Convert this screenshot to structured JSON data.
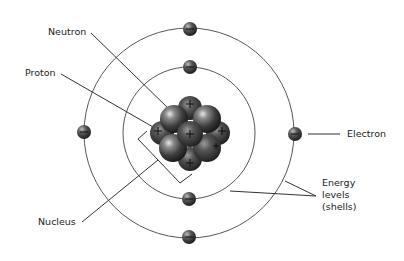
{
  "labels": {
    "neutron": "Neutron",
    "proton": "Proton",
    "electron": "Electron",
    "nucleus": "Nucleus",
    "energy_levels": [
      "Energy",
      "levels",
      "(shells)"
    ]
  },
  "atom": {
    "center": [
      190,
      133
    ],
    "shells": [
      {
        "name": "inner-shell",
        "radius": 66
      },
      {
        "name": "outer-shell",
        "radius": 105
      }
    ],
    "electrons": [
      {
        "shell": "outer",
        "x": 190,
        "y": 29,
        "charge": "-"
      },
      {
        "shell": "inner",
        "x": 190,
        "y": 67,
        "charge": "-"
      },
      {
        "shell": "outer",
        "x": 83,
        "y": 132,
        "charge": "-"
      },
      {
        "shell": "outer",
        "x": 295,
        "y": 134,
        "charge": "-"
      },
      {
        "shell": "inner",
        "x": 189,
        "y": 199,
        "charge": "-"
      },
      {
        "shell": "outer",
        "x": 189,
        "y": 237,
        "charge": "-"
      }
    ],
    "nucleus_particles": [
      {
        "type": "proton",
        "x": 190,
        "y": 108,
        "charge": "+"
      },
      {
        "type": "neutron",
        "x": 173,
        "y": 119
      },
      {
        "type": "neutron",
        "x": 208,
        "y": 119
      },
      {
        "type": "proton",
        "x": 162,
        "y": 133,
        "charge": "+"
      },
      {
        "type": "proton",
        "x": 218,
        "y": 133,
        "charge": "+"
      },
      {
        "type": "proton",
        "x": 190,
        "y": 134,
        "charge": "+"
      },
      {
        "type": "neutron",
        "x": 173,
        "y": 148
      },
      {
        "type": "neutron",
        "x": 207,
        "y": 148
      },
      {
        "type": "proton",
        "x": 190,
        "y": 159,
        "charge": "+"
      }
    ]
  },
  "colors": {
    "line": "#333333",
    "orbit": "#444444",
    "particle_dark": "#2a2a2a",
    "particle_light": "#9a9a9a"
  }
}
